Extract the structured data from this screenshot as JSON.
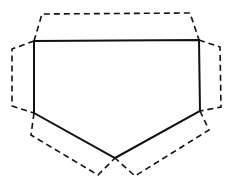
{
  "diagram": {
    "stroke_color": "#111111",
    "background": "#ffffff",
    "solid_pentagon": "34,41 199,40 200,111 115,158 34,113",
    "flaps": [
      {
        "name": "top-flap",
        "points": "34,41 42,14 190,13 199,40"
      },
      {
        "name": "left-flap",
        "points": "34,41 12,49 12,106 34,113"
      },
      {
        "name": "right-flap",
        "points": "199,40 220,47 221,107 200,111"
      },
      {
        "name": "bottom-left-flap",
        "points": "34,113 31,135 98,175 115,158"
      },
      {
        "name": "bottom-right-flap",
        "points": "200,111 209,130 135,176 115,158"
      }
    ]
  }
}
